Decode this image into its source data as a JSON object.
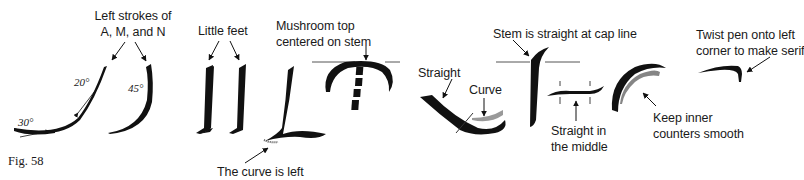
{
  "figure": {
    "label": "Fig. 58",
    "ink_color": "#111111",
    "background": "#ffffff"
  },
  "annotations": {
    "left_strokes": {
      "line1": "Left strokes of",
      "line2": "A, M, and N"
    },
    "angle_30": "30°",
    "angle_20": "20°",
    "angle_45": "45°",
    "little_feet": "Little feet",
    "curve_is_left": "The curve is left",
    "mushroom": {
      "line1": "Mushroom top",
      "line2": "centered on stem"
    },
    "straight": "Straight",
    "curve": "Curve",
    "stem_straight": "Stem is straight at cap line",
    "straight_middle": {
      "line1": "Straight in",
      "line2": "the middle"
    },
    "keep_inner": {
      "line1": "Keep inner",
      "line2": "counters smooth"
    },
    "twist_pen": {
      "line1": "Twist pen onto left",
      "line2": "corner to make serif"
    }
  }
}
